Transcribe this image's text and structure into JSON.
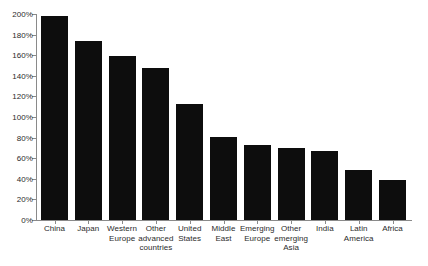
{
  "chart_data": {
    "type": "bar",
    "title": "",
    "xlabel": "",
    "ylabel": "",
    "ylim": [
      0,
      200
    ],
    "ytick_labels": [
      "200%",
      "180%",
      "160%",
      "140%",
      "120%",
      "100%",
      "80%",
      "60%",
      "40%",
      "20%",
      "0%"
    ],
    "ytick_values": [
      200,
      180,
      160,
      140,
      120,
      100,
      80,
      60,
      40,
      20,
      0
    ],
    "grid": false,
    "legend": "none",
    "bar_color": "#0d0d0d",
    "axis_color": "#8a8a8a",
    "categories": [
      "China",
      "Japan",
      "Western Europe",
      "Other advanced countries",
      "United States",
      "Middle East",
      "Emerging Europe",
      "Other emerging Asia",
      "India",
      "Latin America",
      "Africa"
    ],
    "category_lines": [
      [
        "China"
      ],
      [
        "Japan"
      ],
      [
        "Western",
        "Europe"
      ],
      [
        "Other",
        "advanced",
        "countries"
      ],
      [
        "United",
        "States"
      ],
      [
        "Middle",
        "East"
      ],
      [
        "Emerging",
        "Europe"
      ],
      [
        "Other",
        "emerging",
        "Asia"
      ],
      [
        "India"
      ],
      [
        "Latin",
        "America"
      ],
      [
        "Africa"
      ]
    ],
    "values": [
      198,
      174,
      159,
      148,
      113,
      81,
      73,
      70,
      67,
      49,
      39
    ]
  }
}
